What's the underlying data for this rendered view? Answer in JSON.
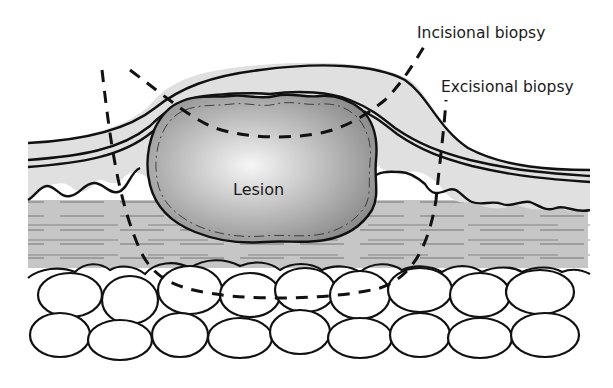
{
  "diagram": {
    "type": "biopsy cross-section illustration",
    "labels": {
      "incisional": "Incisional biopsy",
      "excisional": "Excisional biopsy",
      "lesion": "Lesion"
    },
    "layers": [
      {
        "name": "epidermis",
        "color": "#e2e2e2"
      },
      {
        "name": "dermis",
        "color": "#c8c8c8"
      },
      {
        "name": "subcutaneous fat",
        "color": "#ffffff"
      }
    ],
    "colors": {
      "outline": "#111111",
      "lesion_center": "#f4f4f4",
      "lesion_edge": "#8f8f8f",
      "background": "#ffffff"
    }
  }
}
